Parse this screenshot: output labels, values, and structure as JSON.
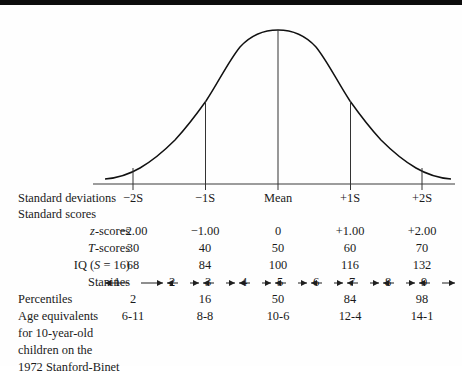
{
  "chart_data": {
    "type": "line",
    "title": "",
    "xlabel": "",
    "ylabel": "",
    "curve": "normal distribution bell curve",
    "xlim": [
      -3.2,
      3.2
    ],
    "ylim": [
      0,
      1
    ],
    "grid": false,
    "legend": null,
    "axis_tick_positions_sd": [
      -2,
      -1,
      0,
      1,
      2
    ],
    "ordinate_lines_at_sd": [
      -2,
      -1,
      0,
      1,
      2
    ],
    "columns": [
      {
        "sd": -2,
        "standard_deviation": "−2S",
        "z": "−2.00",
        "T": "30",
        "IQ": "68",
        "percentile": "2",
        "age_equivalent": "6-11"
      },
      {
        "sd": -1,
        "standard_deviation": "−1S",
        "z": "−1.00",
        "T": "40",
        "IQ": "84",
        "percentile": "16",
        "age_equivalent": "8-8"
      },
      {
        "sd": 0,
        "standard_deviation": "Mean",
        "z": "0",
        "T": "50",
        "IQ": "100",
        "percentile": "50",
        "age_equivalent": "10-6"
      },
      {
        "sd": 1,
        "standard_deviation": "+1S",
        "z": "+1.00",
        "T": "60",
        "IQ": "116",
        "percentile": "84",
        "age_equivalent": "12-4"
      },
      {
        "sd": 2,
        "standard_deviation": "+2S",
        "z": "+2.00",
        "T": "70",
        "IQ": "132",
        "percentile": "98",
        "age_equivalent": "14-1"
      }
    ],
    "stanines": [
      "1",
      "2",
      "3",
      "4",
      "5",
      "6",
      "7",
      "8",
      "9"
    ]
  },
  "rows": {
    "standard_deviations_label": "Standard deviations",
    "standard_scores_label": "Standard scores",
    "z_scores_label": "z-scores",
    "t_scores_label": "T-scores",
    "iq_label": "IQ (S = 16)",
    "stanines_label": "Stanines",
    "percentiles_label": "Percentiles",
    "age_equivalents_label": "Age equivalents",
    "age_line2": "for 10-year-old",
    "age_line3": "children on the",
    "age_line4": "1972 Stanford-Binet"
  },
  "sd_values": {
    "c0": "−2S",
    "c1": "−1S",
    "c2": "Mean",
    "c3": "+1S",
    "c4": "+2S"
  },
  "z_values": {
    "c0": "−2.00",
    "c1": "−1.00",
    "c2": "0",
    "c3": "+1.00",
    "c4": "+2.00"
  },
  "t_values": {
    "c0": "30",
    "c1": "40",
    "c2": "50",
    "c3": "60",
    "c4": "70"
  },
  "iq_values": {
    "c0": "68",
    "c1": "84",
    "c2": "100",
    "c3": "116",
    "c4": "132"
  },
  "pct_values": {
    "c0": "2",
    "c1": "16",
    "c2": "50",
    "c3": "84",
    "c4": "98"
  },
  "age_values": {
    "c0": "6-11",
    "c1": "8-8",
    "c2": "10-6",
    "c3": "12-4",
    "c4": "14-1"
  },
  "stanine_values": {
    "s1": "1",
    "s2": "2",
    "s3": "3",
    "s4": "4",
    "s5": "5",
    "s6": "6",
    "s7": "7",
    "s8": "8",
    "s9": "9"
  },
  "colors": {
    "ink": "#1a1a1a",
    "curve": "#111111",
    "baseline": "#3a3a3a",
    "border": "#0d0d0d",
    "background": "#ffffff"
  }
}
